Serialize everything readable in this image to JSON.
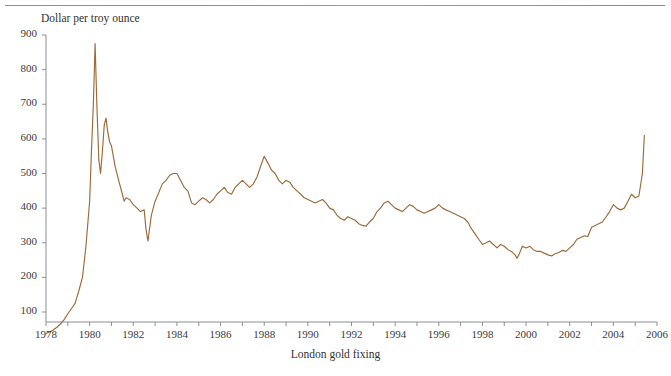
{
  "figure": {
    "header_label": "FIGURE 2-5",
    "y_axis_title": "Dollar per troy ounce",
    "caption": "London gold fixing"
  },
  "colors": {
    "line": "#9a6b38",
    "axis": "#8a8f96",
    "text": "#3a3a3a",
    "rule": "#ab8452",
    "background": "#ffffff"
  },
  "chart_data": {
    "type": "line",
    "title": "",
    "subtitle": "",
    "xlabel": "London gold fixing",
    "ylabel": "Dollar per troy ounce",
    "xlim": [
      1978,
      2006
    ],
    "ylim": [
      35,
      900
    ],
    "grid": false,
    "legend": false,
    "legend_position": "none",
    "y_ticks": [
      100,
      200,
      300,
      400,
      500,
      600,
      700,
      800,
      900
    ],
    "y_tick_labels": [
      "100",
      "200",
      "300",
      "400",
      "500",
      "600",
      "700",
      "800",
      "900"
    ],
    "x_ticks": [
      1978,
      1979,
      1980,
      1981,
      1982,
      1983,
      1984,
      1985,
      1986,
      1987,
      1988,
      1989,
      1990,
      1991,
      1992,
      1993,
      1994,
      1995,
      1996,
      1997,
      1998,
      1999,
      2000,
      2001,
      2002,
      2003,
      2004,
      2005,
      2006
    ],
    "x_tick_labels": [
      "1978",
      "",
      "1980",
      "",
      "1982",
      "",
      "1984",
      "",
      "1986",
      "",
      "1988",
      "",
      "1990",
      "",
      "1992",
      "",
      "1994",
      "",
      "1996",
      "",
      "1998",
      "",
      "2000",
      "",
      "2002",
      "",
      "2004",
      "",
      "2006"
    ],
    "series": [
      {
        "name": "London gold fixing",
        "color": "#9a6b38",
        "x": [
          1978.0,
          1978.17,
          1978.33,
          1978.5,
          1978.67,
          1978.83,
          1979.0,
          1979.17,
          1979.33,
          1979.5,
          1979.67,
          1979.83,
          1980.0,
          1980.08,
          1980.17,
          1980.25,
          1980.33,
          1980.42,
          1980.5,
          1980.58,
          1980.67,
          1980.75,
          1980.83,
          1980.92,
          1981.0,
          1981.17,
          1981.33,
          1981.5,
          1981.58,
          1981.67,
          1981.83,
          1982.0,
          1982.17,
          1982.33,
          1982.5,
          1982.58,
          1982.67,
          1982.83,
          1983.0,
          1983.17,
          1983.33,
          1983.5,
          1983.67,
          1983.83,
          1984.0,
          1984.17,
          1984.33,
          1984.5,
          1984.67,
          1984.83,
          1985.0,
          1985.17,
          1985.33,
          1985.5,
          1985.67,
          1985.83,
          1986.0,
          1986.17,
          1986.33,
          1986.5,
          1986.67,
          1986.83,
          1987.0,
          1987.17,
          1987.33,
          1987.5,
          1987.67,
          1987.83,
          1988.0,
          1988.17,
          1988.33,
          1988.5,
          1988.67,
          1988.83,
          1989.0,
          1989.17,
          1989.33,
          1989.5,
          1989.67,
          1989.83,
          1990.0,
          1990.17,
          1990.33,
          1990.5,
          1990.67,
          1990.83,
          1991.0,
          1991.17,
          1991.33,
          1991.5,
          1991.67,
          1991.83,
          1992.0,
          1992.17,
          1992.33,
          1992.5,
          1992.67,
          1992.83,
          1993.0,
          1993.17,
          1993.33,
          1993.5,
          1993.67,
          1993.83,
          1994.0,
          1994.17,
          1994.33,
          1994.5,
          1994.67,
          1994.83,
          1995.0,
          1995.17,
          1995.33,
          1995.5,
          1995.67,
          1995.83,
          1996.0,
          1996.17,
          1996.33,
          1996.5,
          1996.67,
          1996.83,
          1997.0,
          1997.17,
          1997.33,
          1997.5,
          1997.67,
          1997.83,
          1998.0,
          1998.17,
          1998.33,
          1998.5,
          1998.67,
          1998.83,
          1999.0,
          1999.17,
          1999.33,
          1999.5,
          1999.58,
          1999.67,
          1999.83,
          2000.0,
          2000.17,
          2000.33,
          2000.5,
          2000.67,
          2000.83,
          2001.0,
          2001.17,
          2001.33,
          2001.5,
          2001.67,
          2001.83,
          2002.0,
          2002.17,
          2002.33,
          2002.5,
          2002.67,
          2002.83,
          2003.0,
          2003.17,
          2003.33,
          2003.5,
          2003.67,
          2003.83,
          2004.0,
          2004.17,
          2004.33,
          2004.5,
          2004.67,
          2004.83,
          2005.0,
          2005.17,
          2005.33,
          2005.42
        ],
        "y": [
          38,
          42,
          48,
          56,
          66,
          78,
          95,
          110,
          125,
          160,
          200,
          290,
          420,
          560,
          700,
          875,
          700,
          540,
          500,
          560,
          640,
          660,
          620,
          590,
          580,
          520,
          480,
          440,
          420,
          430,
          425,
          410,
          400,
          390,
          395,
          340,
          305,
          380,
          420,
          445,
          470,
          480,
          495,
          500,
          500,
          480,
          460,
          450,
          415,
          410,
          420,
          430,
          425,
          415,
          425,
          440,
          450,
          460,
          445,
          440,
          460,
          470,
          480,
          470,
          460,
          470,
          490,
          520,
          550,
          530,
          510,
          500,
          480,
          470,
          480,
          475,
          460,
          450,
          440,
          430,
          425,
          420,
          415,
          420,
          425,
          415,
          400,
          395,
          380,
          370,
          365,
          375,
          370,
          365,
          355,
          350,
          348,
          360,
          370,
          390,
          400,
          415,
          420,
          410,
          400,
          395,
          390,
          400,
          410,
          405,
          395,
          390,
          385,
          390,
          395,
          400,
          410,
          400,
          395,
          390,
          385,
          380,
          375,
          370,
          360,
          340,
          325,
          310,
          295,
          300,
          305,
          295,
          285,
          295,
          290,
          280,
          275,
          265,
          255,
          265,
          290,
          285,
          290,
          280,
          275,
          275,
          270,
          265,
          262,
          268,
          272,
          278,
          275,
          285,
          295,
          310,
          315,
          320,
          318,
          345,
          350,
          355,
          360,
          375,
          390,
          410,
          400,
          395,
          400,
          420,
          440,
          430,
          435,
          500,
          610
        ]
      }
    ]
  }
}
